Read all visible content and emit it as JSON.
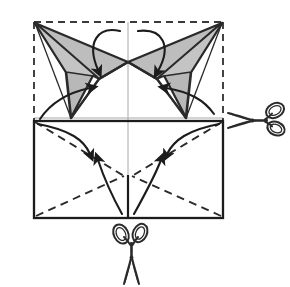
{
  "figure": {
    "background_color": "#ffffff",
    "width": 290,
    "height": 287,
    "alt_text": "Square sheet shown with dashed original outline, two gray shaded pointed flaps folded down from the top corners toward the center, a solid rectangle below with dashed diagonal fold creases, curved direction arrows, and two scissors symbols indicating cut locations."
  },
  "style": {
    "ink_color": "#1c1c1c",
    "shade_fill": "#b9b9b9",
    "shade_stroke": "#2a2a2a",
    "dashed_guide_color": "#3a3a3a",
    "faint_crease_color": "#a8a8a8",
    "paper_color": "#ffffff",
    "scissors_color": "#2b2b2b"
  },
  "geometry": {
    "dashed_square": {
      "label": "original-paper-outline",
      "top_left": [
        34,
        22
      ],
      "top_right": [
        223,
        22
      ],
      "bottom_right": [
        223,
        218
      ],
      "bottom_left": [
        34,
        218
      ],
      "dash_pattern": "7,5"
    },
    "solid_rectangle": {
      "label": "folded-lower-panel",
      "top_left": [
        34,
        121
      ],
      "top_right": [
        223,
        121
      ],
      "bottom_right": [
        223,
        218
      ],
      "bottom_left": [
        34,
        218
      ]
    },
    "faint_creases": {
      "vertical_center_x": 128,
      "horizontal_mid_y": 118
    },
    "center_vertical_solid": {
      "from": [
        128,
        175
      ],
      "to": [
        128,
        218
      ]
    },
    "left_flap": {
      "label": "left-shaded-flap",
      "apex": [
        35,
        23
      ],
      "inner_point": [
        128,
        62
      ],
      "lower_point": [
        71,
        118
      ],
      "mid_point": [
        99,
        82
      ]
    },
    "right_flap": {
      "label": "right-shaded-flap",
      "apex": [
        222,
        23
      ],
      "inner_point": [
        128,
        62
      ],
      "lower_point": [
        186,
        118
      ],
      "mid_point": [
        157,
        82
      ]
    },
    "dashed_creases_lower": [
      {
        "name": "left-diagonal-crease",
        "from": [
          34,
          121
        ],
        "to": [
          36,
          217
        ]
      },
      {
        "name": "left-lower-crease",
        "from": [
          36,
          217
        ],
        "to": [
          128,
          175
        ]
      },
      {
        "name": "right-diagonal-crease",
        "from": [
          223,
          121
        ],
        "to": [
          221,
          217
        ]
      },
      {
        "name": "right-lower-crease",
        "from": [
          221,
          217
        ],
        "to": [
          128,
          175
        ]
      }
    ]
  },
  "arrows": [
    {
      "name": "arrow-top-left-fold-down",
      "description": "curved arrow from top center arcing down-left into left flap",
      "start": [
        122,
        32
      ],
      "control": [
        88,
        30
      ],
      "end": [
        98,
        72
      ],
      "head_angle": 110
    },
    {
      "name": "arrow-top-right-fold-down",
      "description": "curved arrow from top center arcing down-right into right flap",
      "start": [
        136,
        32
      ],
      "control": [
        168,
        34
      ],
      "end": [
        157,
        73
      ],
      "head_angle": 72
    },
    {
      "name": "arrow-left-flap-up",
      "description": "curved arrow from lower-left rising up-right into left flap",
      "start": [
        41,
        117
      ],
      "control": [
        58,
        100
      ],
      "end": [
        92,
        90
      ],
      "head_angle": 330
    },
    {
      "name": "arrow-right-flap-up",
      "description": "curved arrow from lower-right rising up-left into right flap",
      "start": [
        214,
        113
      ],
      "control": [
        196,
        98
      ],
      "end": [
        164,
        89
      ],
      "head_angle": 205
    },
    {
      "name": "arrow-upper-left-inward",
      "description": "curved arrow from rectangle top-left sweeping to interior",
      "start": [
        38,
        123
      ],
      "control": [
        72,
        133
      ],
      "end": [
        92,
        156
      ],
      "head_angle": 55
    },
    {
      "name": "arrow-upper-right-inward",
      "description": "curved arrow from rectangle top-right sweeping to interior",
      "start": [
        219,
        123
      ],
      "control": [
        186,
        133
      ],
      "end": [
        165,
        156
      ],
      "head_angle": 125
    },
    {
      "name": "arrow-lower-left-outward",
      "description": "curved arrow from bottom center rising up-left",
      "start": [
        121,
        214
      ],
      "control": [
        106,
        192
      ],
      "end": [
        96,
        158
      ],
      "head_angle": 287
    },
    {
      "name": "arrow-lower-right-outward",
      "description": "curved arrow from bottom center rising up-right",
      "start": [
        135,
        214
      ],
      "control": [
        150,
        192
      ],
      "end": [
        163,
        158
      ],
      "head_angle": 250
    }
  ],
  "scissors": [
    {
      "name": "scissors-right",
      "orientation": "horizontal-pointing-left",
      "position": [
        250,
        120
      ],
      "scale": 1.0,
      "rotation_deg": 0,
      "meaning": "cut-line-right"
    },
    {
      "name": "scissors-bottom",
      "orientation": "vertical-pointing-up",
      "position": [
        131,
        258
      ],
      "scale": 1.0,
      "rotation_deg": -90,
      "meaning": "cut-line-bottom"
    }
  ],
  "annotations": {
    "fold_arrow_count": 8,
    "scissors_count": 2,
    "shaded_flap_count": 2
  }
}
